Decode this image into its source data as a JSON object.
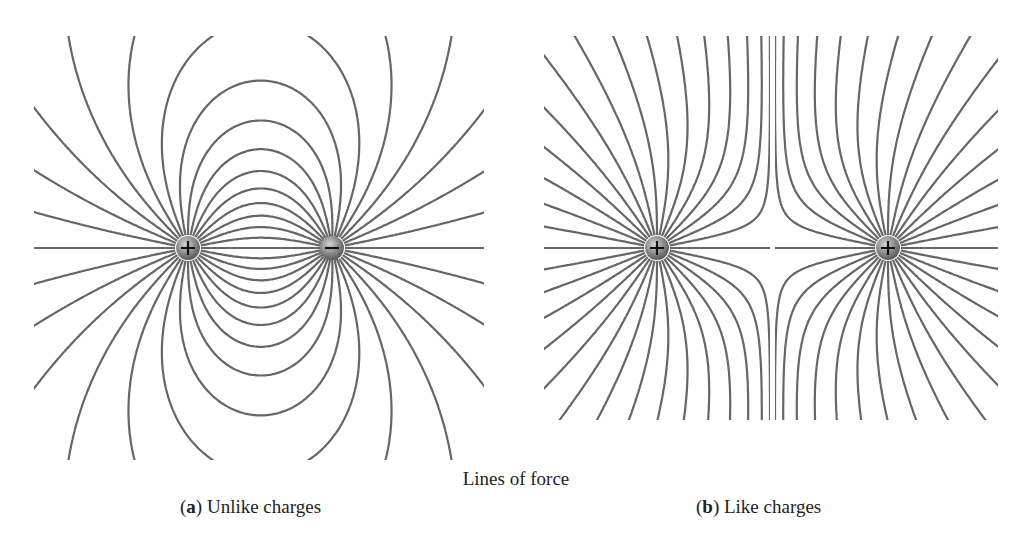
{
  "figure": {
    "title": "Lines of force",
    "panels": [
      {
        "id": "a",
        "letter": "a",
        "caption": "Unlike charges",
        "charges": [
          {
            "sign": "+",
            "symbol": "+",
            "x": 188,
            "y": 248
          },
          {
            "sign": "-",
            "symbol": "−",
            "x": 332,
            "y": 248
          }
        ],
        "clip": {
          "x0": 34,
          "y0": 36,
          "x1": 484,
          "y1": 460
        }
      },
      {
        "id": "b",
        "letter": "b",
        "caption": "Like charges",
        "charges": [
          {
            "sign": "+",
            "symbol": "+",
            "x": 657,
            "y": 248
          },
          {
            "sign": "+",
            "symbol": "+",
            "x": 888,
            "y": 248
          }
        ],
        "clip": {
          "x0": 544,
          "y0": 36,
          "x1": 998,
          "y1": 420
        }
      }
    ],
    "colors": {
      "line": "#666666",
      "charge": "#8a8a8a",
      "text": "#222222"
    },
    "lines_per_charge": 32
  }
}
